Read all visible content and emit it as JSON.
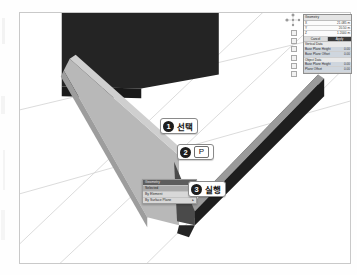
{
  "viewport": {
    "name": "3d-viewport",
    "background_color": "#ffffff",
    "grid_color": "#d2d2d2"
  },
  "geometry": {
    "panels": [
      {
        "name": "back-wall-panel",
        "shade": "dark",
        "color": "#242424"
      },
      {
        "name": "left-wall-panel",
        "shade": "light",
        "color": "#b6b6b6"
      },
      {
        "name": "right-wall-panel",
        "shade": "dark",
        "color": "#2a2a2a"
      },
      {
        "name": "right-wall-top-edge",
        "shade": "medium",
        "color": "#9a9a9a"
      }
    ]
  },
  "callouts": [
    {
      "number": "1",
      "label": "선택",
      "key": ""
    },
    {
      "number": "2",
      "label": "",
      "key": "P"
    },
    {
      "number": "3",
      "label": "실행",
      "key": ""
    }
  ],
  "context_menu": {
    "title": "Geometry",
    "items": [
      {
        "label": "Selected",
        "selected": true,
        "submenu": false
      },
      {
        "label": "By Element",
        "selected": false,
        "submenu": true
      },
      {
        "label": "By Surface Plane",
        "selected": false,
        "submenu": true
      }
    ]
  },
  "properties_panel": {
    "title": "Geometry",
    "rows": [
      {
        "label": "X",
        "value": "21.085 m"
      },
      {
        "label": "Y",
        "value": "20.50 m"
      },
      {
        "label": "Z",
        "value": "1.2000 m"
      }
    ],
    "buttons": [
      {
        "label": "Cancel",
        "active": false
      },
      {
        "label": "Apply",
        "active": true
      }
    ],
    "sections": [
      {
        "title": "Vertical Data",
        "rows": [
          {
            "label": "Base Plane Height",
            "value": "0.00"
          },
          {
            "label": "Base Plane Offset",
            "value": "0.00"
          }
        ]
      },
      {
        "title": "Object Data",
        "rows": [
          {
            "label": "Base Plane Height",
            "value": "0.00"
          },
          {
            "label": "Plane Offset",
            "value": "0.00"
          }
        ]
      }
    ]
  },
  "gizmo": {
    "name": "view-orientation-gizmo"
  },
  "mini_toolbar": {
    "button_count": 6
  }
}
